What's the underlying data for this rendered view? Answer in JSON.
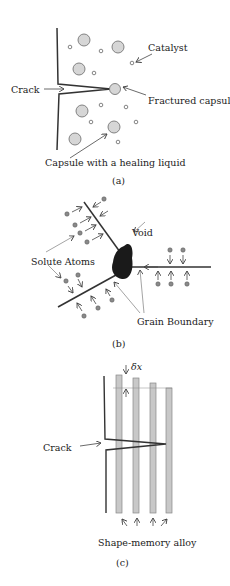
{
  "colors": {
    "line": "#333333",
    "capsule_fill": "#d6d6d6",
    "capsule_stroke": "#777777",
    "void_fill": "#1a1a1a",
    "bar_fill": "#c8c8c8",
    "arrow_thin": "#555555"
  },
  "panel_a": {
    "caption": "(a)",
    "labels": {
      "catalyst": "Catalyst",
      "crack": "Crack",
      "fractured_capsule": "Fractured capsule",
      "capsule_healing": "Capsule with a healing liquid"
    }
  },
  "panel_b": {
    "caption": "(b)",
    "labels": {
      "void": "Void",
      "solute_atoms": "Solute Atoms",
      "grain_boundary": "Grain Boundary"
    }
  },
  "panel_c": {
    "caption": "(c)",
    "labels": {
      "delta_x": "δx",
      "crack": "Crack",
      "shape_memory_alloy": "Shape-memory alloy"
    }
  }
}
